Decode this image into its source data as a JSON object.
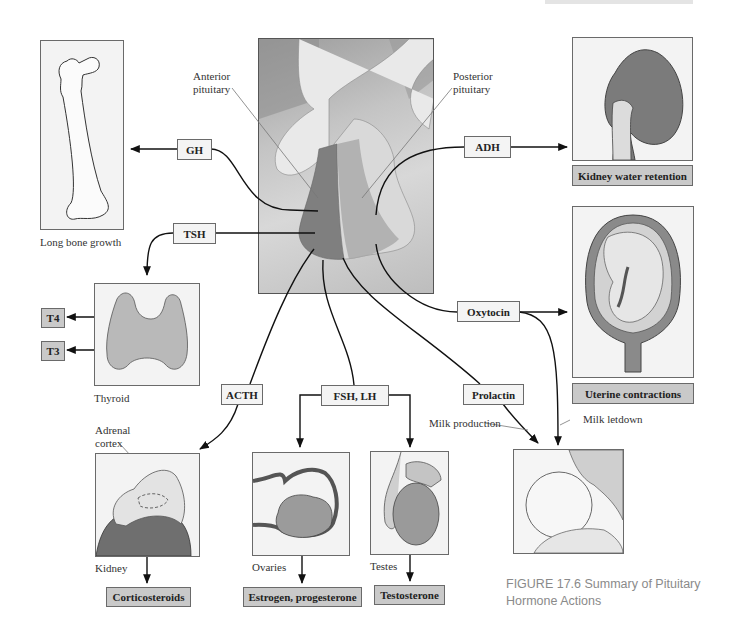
{
  "figure": {
    "caption_line1": "FIGURE 17.6  Summary of Pituitary",
    "caption_line2": "Hormone Actions"
  },
  "pituitary": {
    "anterior_label_1": "Anterior",
    "anterior_label_2": "pituitary",
    "posterior_label_1": "Posterior",
    "posterior_label_2": "pituitary"
  },
  "hormones": {
    "gh": "GH",
    "tsh": "TSH",
    "adh": "ADH",
    "oxytocin": "Oxytocin",
    "acth": "ACTH",
    "fsh_lh": "FSH, LH",
    "prolactin": "Prolactin",
    "t4": "T4",
    "t3": "T3"
  },
  "targets": {
    "bone": "Long bone growth",
    "thyroid": "Thyroid",
    "adrenal_1": "Adrenal",
    "adrenal_2": "cortex",
    "kidney": "Kidney",
    "ovaries": "Ovaries",
    "testes": "Testes",
    "milk_production": "Milk production",
    "milk_letdown": "Milk letdown"
  },
  "effects": {
    "kidney_water": "Kidney water retention",
    "uterine": "Uterine contractions",
    "corticosteroids": "Corticosteroids",
    "estrogen": "Estrogen, progesterone",
    "testosterone": "Testosterone"
  }
}
